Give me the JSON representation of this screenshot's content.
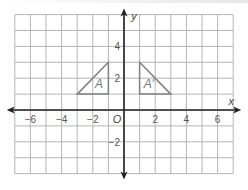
{
  "figure": {
    "type": "coordinate-grid",
    "x_axis": {
      "label": "x",
      "range": [
        -7,
        7
      ],
      "tick_labels": [
        "−6",
        "−4",
        "−2",
        "2",
        "4",
        "6"
      ],
      "tick_values": [
        -6,
        -4,
        -2,
        2,
        4,
        6
      ]
    },
    "y_axis": {
      "label": "y",
      "range": [
        -4,
        6
      ],
      "tick_labels": [
        "4",
        "2",
        "−2"
      ],
      "tick_values": [
        4,
        2,
        -2
      ]
    },
    "origin_label": "O",
    "shapes": [
      {
        "name": "A",
        "label": "A",
        "vertices": [
          [
            -3,
            1
          ],
          [
            -1,
            1
          ],
          [
            -1,
            3
          ]
        ]
      },
      {
        "name": "A_prime",
        "label": "A′",
        "vertices": [
          [
            1,
            1
          ],
          [
            3,
            1
          ],
          [
            1,
            3
          ]
        ]
      }
    ],
    "colors": {
      "grid": "#b5b5b5",
      "axis": "#222222",
      "shape": "#808080",
      "label": "#555555"
    }
  }
}
